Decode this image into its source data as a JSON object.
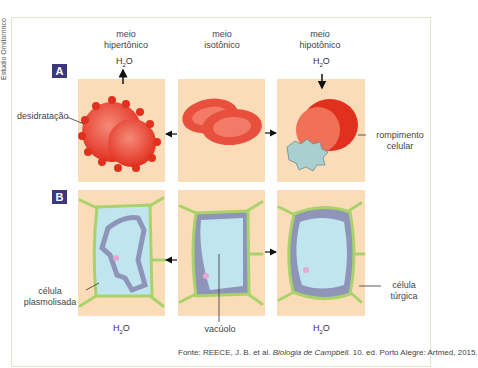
{
  "side_credit": "Estúdio Ornitorrinco",
  "columns": [
    {
      "title_line1": "meio",
      "title_line2": "hipertônico"
    },
    {
      "title_line1": "meio",
      "title_line2": "isotônico"
    },
    {
      "title_line1": "meio",
      "title_line2": "hipotônico"
    }
  ],
  "rows": {
    "a": {
      "badge": "A",
      "left_label": "desidratação",
      "right_label_line1": "rompimento",
      "right_label_line2": "celular"
    },
    "b": {
      "badge": "B",
      "left_label_line1": "célula",
      "left_label_line2": "plasmolisada",
      "center_label": "vacúolo",
      "right_label_line1": "célula",
      "right_label_line2": "túrgica"
    }
  },
  "water": {
    "h": "H",
    "sub": "2",
    "o": "O"
  },
  "source": {
    "prefix": "Fonte: REECE, J. B. et al. ",
    "title": "Biologia de Campbell.",
    "suffix": " 10. ed. Porto Alegre: Artmed, 2015."
  },
  "colors": {
    "panel": "#fbdcb8",
    "badge": "#3d3780",
    "rbc": "#e8372b",
    "cell_wall": "#a9d36a",
    "vacuole": "#bfe6ee",
    "cytoplasm": "#8f95b8"
  }
}
